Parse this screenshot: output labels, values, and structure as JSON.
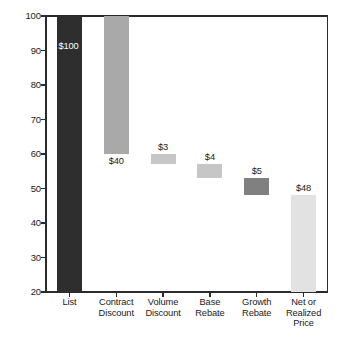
{
  "chart_data": {
    "type": "bar",
    "subtype": "waterfall",
    "title": "",
    "xlabel": "",
    "ylabel": "",
    "ylim": [
      20,
      100
    ],
    "yticks": [
      20,
      30,
      40,
      50,
      60,
      70,
      80,
      90,
      100
    ],
    "ytick_labels": [
      "20",
      "30",
      "40",
      "50",
      "60",
      "70",
      "80",
      "90",
      "100"
    ],
    "grid": false,
    "legend": "none",
    "categories": [
      "List",
      "Contract Discount",
      "Volume Discount",
      "Base Rebate",
      "Growth Rebate",
      "Net or Realized Price"
    ],
    "category_labels": [
      "List",
      "Contract\nDiscount",
      "Volume\nDiscount",
      "Base\nRebate",
      "Growth\nRebate",
      "Net or\nRealized\nPrice"
    ],
    "values": [
      100,
      40,
      3,
      4,
      5,
      48
    ],
    "data_labels": [
      "$100",
      "$40",
      "$3",
      "$4",
      "$5",
      "$48"
    ],
    "bars": [
      {
        "category": "List",
        "label": "$100",
        "value": 100,
        "top": 100,
        "bottom": 20,
        "kind": "total",
        "color": "#2e2e2e",
        "label_position": "inside-top",
        "label_color": "#ffffff"
      },
      {
        "category": "Contract Discount",
        "label": "$40",
        "value": 40,
        "top": 100,
        "bottom": 60,
        "kind": "decrease",
        "color": "#a9a9a9",
        "label_position": "below",
        "label_color": "#1a1a1a"
      },
      {
        "category": "Volume Discount",
        "label": "$3",
        "value": 3,
        "top": 60,
        "bottom": 57,
        "kind": "decrease",
        "color": "#c6c6c6",
        "label_position": "above",
        "label_color": "#1a1a1a"
      },
      {
        "category": "Base Rebate",
        "label": "$4",
        "value": 4,
        "top": 57,
        "bottom": 53,
        "kind": "decrease",
        "color": "#c6c6c6",
        "label_position": "above",
        "label_color": "#1a1a1a"
      },
      {
        "category": "Growth Rebate",
        "label": "$5",
        "value": 5,
        "top": 53,
        "bottom": 48,
        "kind": "decrease",
        "color": "#808080",
        "label_position": "above",
        "label_color": "#1a1a1a"
      },
      {
        "category": "Net or Realized Price",
        "label": "$48",
        "value": 48,
        "top": 48,
        "bottom": 20,
        "kind": "total",
        "color": "#e2e2e2",
        "label_position": "above",
        "label_color": "#1a1a1a"
      }
    ],
    "colors": {
      "axis": "#2b2b2b",
      "background": "#ffffff",
      "text": "#1a1a1a"
    }
  },
  "caption": {
    "text": ""
  }
}
